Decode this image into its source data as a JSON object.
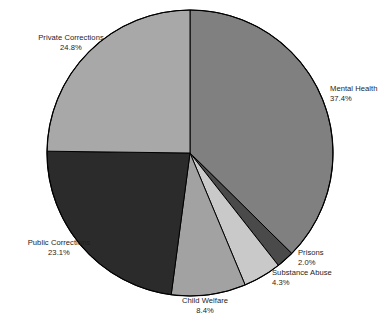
{
  "chart_data": {
    "type": "pie",
    "title": "",
    "categories": [
      "Mental Health",
      "Prisons",
      "Substance Abuse",
      "Child Welfare",
      "Public Corrections",
      "Private Corrections"
    ],
    "values": [
      37.4,
      2.0,
      4.3,
      8.4,
      23.1,
      24.8
    ],
    "value_unit": "%",
    "start_angle_deg": 0,
    "direction": "clockwise",
    "legend": "none",
    "grid": false,
    "slices": [
      {
        "name": "Mental Health",
        "value": 37.4,
        "label": "Mental Health",
        "percent_text": "37.4%",
        "color": "#808080"
      },
      {
        "name": "Prisons",
        "value": 2.0,
        "label": "Prisons",
        "percent_text": "2.0%",
        "color": "#4a4a4a"
      },
      {
        "name": "Substance Abuse",
        "value": 4.3,
        "label": "Substance Abuse",
        "percent_text": "4.3%",
        "color": "#c9c9c9"
      },
      {
        "name": "Child Welfare",
        "value": 8.4,
        "label": "Child Welfare",
        "percent_text": "8.4%",
        "color": "#a2a2a2"
      },
      {
        "name": "Public Corrections",
        "value": 23.1,
        "label": "Public Corrections",
        "percent_text": "23.1%",
        "color": "#2b2b2b"
      },
      {
        "name": "Private Corrections",
        "value": 24.8,
        "label": "Private Corrections",
        "percent_text": "24.8%",
        "color": "#a8a8a8"
      }
    ],
    "outline_color": "#000000",
    "background": "#ffffff"
  },
  "footer": {
    "caption": ""
  }
}
